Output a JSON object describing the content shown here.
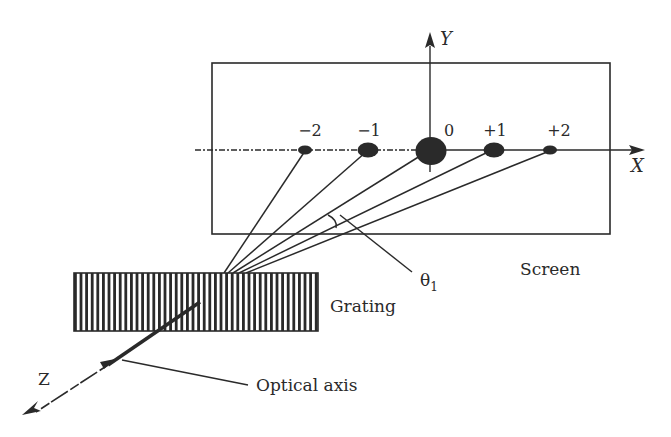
{
  "diagram": {
    "type": "diffraction-grating-schematic",
    "colors": {
      "ink": "#2a2a2a",
      "background": "#ffffff"
    },
    "axes": {
      "x_label": "X",
      "y_label": "Y",
      "z_label": "Z"
    },
    "orders": [
      {
        "label": "−2",
        "order": -2,
        "spot_size": "small"
      },
      {
        "label": "−1",
        "order": -1,
        "spot_size": "medium"
      },
      {
        "label": "0",
        "order": 0,
        "spot_size": "large"
      },
      {
        "label": "+1",
        "order": 1,
        "spot_size": "medium"
      },
      {
        "label": "+2",
        "order": 2,
        "spot_size": "small"
      }
    ],
    "labels": {
      "angle": "θ",
      "angle_subscript": "1",
      "screen": "Screen",
      "grating": "Grating",
      "optical_axis": "Optical axis"
    }
  }
}
